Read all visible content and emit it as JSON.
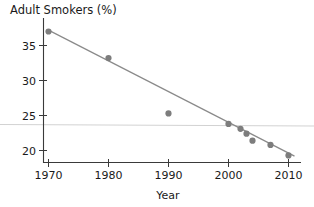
{
  "chart_data": {
    "type": "scatter",
    "title": "Adult Smokers (%)",
    "xlabel": "Year",
    "ylabel": "",
    "xlim": [
      1966,
      2013
    ],
    "ylim": [
      17.8,
      38.6
    ],
    "grid": false,
    "legend": null,
    "xticks": [
      1970,
      1980,
      1990,
      2000,
      2010
    ],
    "xticklabels": [
      "1970",
      "1980",
      "1990",
      "2000",
      "2010"
    ],
    "yticks": [
      20,
      25,
      30,
      35
    ],
    "yticklabels": [
      "20",
      "25",
      "30",
      "35"
    ],
    "series": [
      {
        "name": "Adult Smokers",
        "type": "scatter",
        "marker": "circle",
        "color": "#7d7d7d",
        "x": [
          1970,
          1980,
          1990,
          2000,
          2002,
          2003,
          2004,
          2007,
          2010
        ],
        "y": [
          37.0,
          33.2,
          25.3,
          23.8,
          23.1,
          22.4,
          21.4,
          20.8,
          19.3
        ]
      },
      {
        "name": "Trend line",
        "type": "line",
        "color": "#8a8a8a",
        "x": [
          1970,
          2011
        ],
        "y": [
          37.2,
          19.2
        ]
      },
      {
        "name": "Reference line",
        "type": "hline",
        "color": "#d2d2d2",
        "y": 23.5
      }
    ]
  },
  "title": "Adult Smokers (%)",
  "xlabel": "Year"
}
